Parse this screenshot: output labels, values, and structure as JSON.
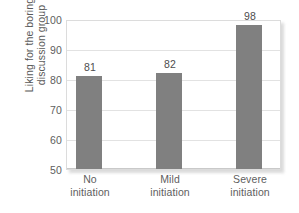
{
  "chart_data": {
    "type": "bar",
    "title": "",
    "xlabel": "",
    "ylabel": "Liking for the boring discussion group",
    "ylabel_lines": [
      "Liking for the boring",
      "discussion group"
    ],
    "categories": [
      "No initiation",
      "Mild initiation",
      "Severe initiation"
    ],
    "category_lines": [
      [
        "No",
        "initiation"
      ],
      [
        "Mild",
        "initiation"
      ],
      [
        "Severe",
        "initiation"
      ]
    ],
    "values": [
      81,
      82,
      98
    ],
    "value_labels": [
      "81",
      "82",
      "98"
    ],
    "ylim": [
      50,
      100
    ],
    "yticks": [
      50,
      60,
      70,
      80,
      90,
      100
    ],
    "ytick_labels": [
      "50",
      "60",
      "70",
      "80",
      "90",
      "100"
    ],
    "grid": true,
    "grid_axis": "y",
    "legend": null,
    "bar_color": "#808080",
    "plot_background": "#ffffff",
    "gridline_color": "#e2e2e2",
    "text_color": "#5e5e5e"
  },
  "figure": {
    "background": "#ffffff",
    "caption_remnant": ""
  }
}
